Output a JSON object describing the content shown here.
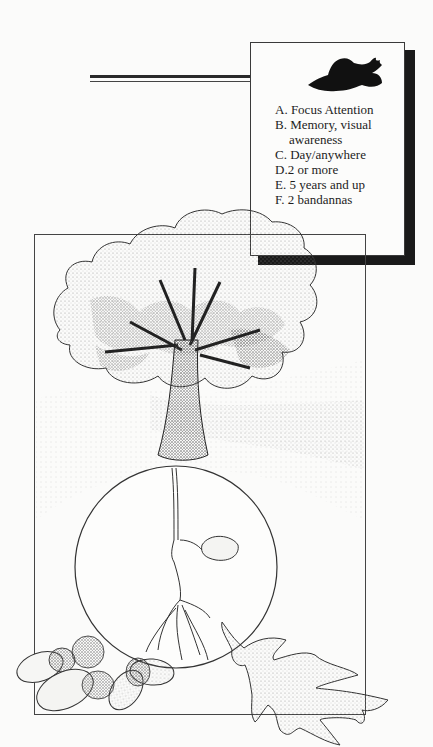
{
  "info_box": {
    "icon": "bird-silhouette-icon",
    "items": [
      {
        "letter": "A.",
        "text": "Focus Attention"
      },
      {
        "letter": "B.",
        "text": "Memory, visual"
      },
      {
        "letter": "",
        "text": "awareness"
      },
      {
        "letter": "C.",
        "text": "Day/anywhere"
      },
      {
        "letter": "D.",
        "text": "2 or more"
      },
      {
        "letter": "E.",
        "text": "5 years and up"
      },
      {
        "letter": "F.",
        "text": " 2 bandannas"
      }
    ]
  },
  "illustration": {
    "subjects": [
      "oak-tree",
      "seedling-in-circle",
      "acorns",
      "oak-leaf"
    ]
  },
  "colors": {
    "ink": "#1d1d1d",
    "paper": "#fbfbfa",
    "shadow": "#1a1a1a"
  }
}
